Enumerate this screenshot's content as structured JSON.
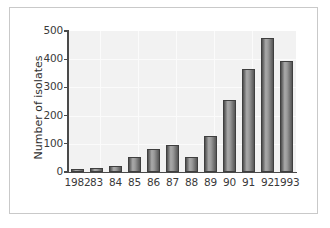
{
  "figure": {
    "background_color": "#ffffff",
    "frame_color": "#c9c9c9",
    "plot_background_color": "#f2f2f2",
    "bar_color": "#8c8c8c",
    "bar_edge_color": "#3f3f3f",
    "axis_color": "#4a4a4a"
  },
  "chart_data": {
    "type": "bar",
    "title": "",
    "xlabel": "",
    "ylabel": "Number of isolates",
    "categories": [
      "1982",
      "83",
      "84",
      "85",
      "86",
      "87",
      "88",
      "89",
      "90",
      "91",
      "92",
      "1993"
    ],
    "values": [
      10,
      15,
      20,
      55,
      83,
      97,
      53,
      127,
      256,
      365,
      477,
      395
    ],
    "ylim": [
      0,
      500
    ],
    "yticks": [
      0,
      100,
      200,
      300,
      400,
      500
    ],
    "ytick_labels": [
      "0",
      "100",
      "200",
      "300",
      "400",
      "500"
    ],
    "grid": true,
    "legend": null,
    "series": [
      {
        "name": "Number of isolates",
        "values": [
          10,
          15,
          20,
          55,
          83,
          97,
          53,
          127,
          256,
          365,
          477,
          395
        ]
      }
    ]
  }
}
